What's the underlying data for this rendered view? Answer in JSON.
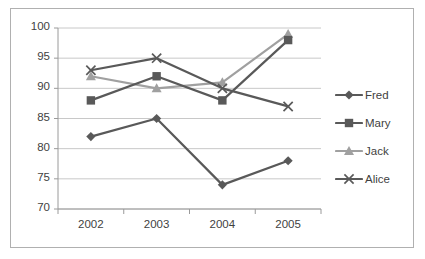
{
  "chart_data": {
    "type": "line",
    "title": "",
    "xlabel": "",
    "ylabel": "",
    "categories": [
      "2002",
      "2003",
      "2004",
      "2005"
    ],
    "ylim": [
      70,
      100
    ],
    "yticks": [
      70,
      75,
      80,
      85,
      90,
      95,
      100
    ],
    "grid": true,
    "legend_position": "right",
    "series": [
      {
        "name": "Fred",
        "marker": "diamond",
        "color": "#595959",
        "values": [
          82,
          85,
          74,
          78
        ]
      },
      {
        "name": "Mary",
        "marker": "square",
        "color": "#595959",
        "values": [
          88,
          92,
          88,
          98
        ]
      },
      {
        "name": "Jack",
        "marker": "triangle",
        "color": "#a0a0a0",
        "values": [
          92,
          90,
          91,
          99
        ]
      },
      {
        "name": "Alice",
        "marker": "cross",
        "color": "#595959",
        "values": [
          93,
          95,
          90,
          87
        ]
      }
    ]
  },
  "axis": {
    "y_labels": [
      "100",
      "95",
      "90",
      "85",
      "80",
      "75",
      "70"
    ],
    "x_labels": [
      "2002",
      "2003",
      "2004",
      "2005"
    ]
  },
  "legend": {
    "items": [
      {
        "label": "Fred"
      },
      {
        "label": "Mary"
      },
      {
        "label": "Jack"
      },
      {
        "label": "Alice"
      }
    ]
  },
  "colors": {
    "series_dark": "#595959",
    "series_light": "#a0a0a0",
    "grid": "#c8c8c8",
    "axis": "#9a9a9a",
    "frame": "#b0b0b0",
    "text": "#3f3f3f",
    "background": "#ffffff"
  }
}
